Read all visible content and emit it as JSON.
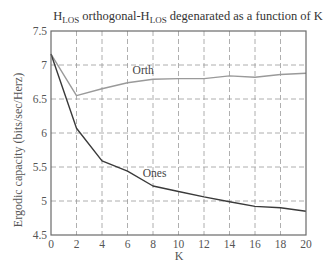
{
  "chart_data": {
    "type": "line",
    "title_parts": {
      "h1": "H",
      "sub1": "LOS",
      "mid": " orthogonal-H",
      "sub2": "LOS",
      "end": " degenarated as a function of K"
    },
    "xlabel": "K",
    "ylabel": "Ergodic capacity (bits/sec/Herz)",
    "xlim": [
      0,
      20
    ],
    "ylim": [
      4.5,
      7.5
    ],
    "xticks": [
      0,
      2,
      4,
      6,
      8,
      10,
      12,
      14,
      16,
      18,
      20
    ],
    "yticks": [
      4.5,
      5,
      5.5,
      6,
      6.5,
      7,
      7.5
    ],
    "ytick_labels": [
      "4.5",
      "5",
      "5.5",
      "6",
      "6.5",
      "7",
      "7.5"
    ],
    "grid": true,
    "legend": "inline labels",
    "x": [
      0,
      2,
      4,
      6,
      8,
      10,
      12,
      14,
      16,
      18,
      20
    ],
    "series": [
      {
        "name": "Orth",
        "color": "#9a9a9a",
        "values": [
          7.16,
          6.55,
          6.65,
          6.74,
          6.79,
          6.8,
          6.8,
          6.84,
          6.82,
          6.86,
          6.88
        ],
        "label_at": {
          "x": 6.4,
          "y": 6.87
        }
      },
      {
        "name": "Ones",
        "color": "#3a3a3a",
        "values": [
          7.16,
          6.07,
          5.59,
          5.44,
          5.22,
          5.14,
          5.06,
          4.99,
          4.92,
          4.9,
          4.85
        ],
        "label_at": {
          "x": 7.2,
          "y": 5.36
        }
      }
    ]
  }
}
